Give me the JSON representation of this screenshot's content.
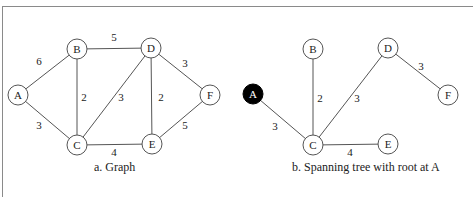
{
  "figures": [
    {
      "caption": "a. Graph",
      "nodes": [
        {
          "id": "A",
          "label": "A",
          "x": 18,
          "y": 95,
          "filled": false
        },
        {
          "id": "B",
          "label": "B",
          "x": 77,
          "y": 49,
          "filled": false
        },
        {
          "id": "D",
          "label": "D",
          "x": 151,
          "y": 48,
          "filled": false
        },
        {
          "id": "F",
          "label": "F",
          "x": 210,
          "y": 95,
          "filled": false
        },
        {
          "id": "C",
          "label": "C",
          "x": 77,
          "y": 145,
          "filled": false
        },
        {
          "id": "E",
          "label": "E",
          "x": 152,
          "y": 144,
          "filled": false
        }
      ],
      "edges": [
        {
          "from": "A",
          "to": "B",
          "weight": "6",
          "lx": 39,
          "ly": 65
        },
        {
          "from": "A",
          "to": "C",
          "weight": "3",
          "lx": 39,
          "ly": 129
        },
        {
          "from": "B",
          "to": "D",
          "weight": "5",
          "lx": 114,
          "ly": 41
        },
        {
          "from": "B",
          "to": "C",
          "weight": "2",
          "lx": 84,
          "ly": 101
        },
        {
          "from": "C",
          "to": "D",
          "weight": "3",
          "lx": 121,
          "ly": 101
        },
        {
          "from": "D",
          "to": "E",
          "weight": "2",
          "lx": 161,
          "ly": 101
        },
        {
          "from": "D",
          "to": "F",
          "weight": "3",
          "lx": 185,
          "ly": 67
        },
        {
          "from": "E",
          "to": "F",
          "weight": "5",
          "lx": 185,
          "ly": 129
        },
        {
          "from": "C",
          "to": "E",
          "weight": "4",
          "lx": 114,
          "ly": 156
        }
      ]
    },
    {
      "caption": "b. Spanning tree with root at A",
      "nodes": [
        {
          "id": "A",
          "label": "A",
          "x": 253,
          "y": 94,
          "filled": true
        },
        {
          "id": "B",
          "label": "B",
          "x": 313,
          "y": 49,
          "filled": false
        },
        {
          "id": "D",
          "label": "D",
          "x": 388,
          "y": 48,
          "filled": false
        },
        {
          "id": "F",
          "label": "F",
          "x": 448,
          "y": 95,
          "filled": false
        },
        {
          "id": "C",
          "label": "C",
          "x": 313,
          "y": 145,
          "filled": false
        },
        {
          "id": "E",
          "label": "E",
          "x": 388,
          "y": 144,
          "filled": false
        }
      ],
      "edges": [
        {
          "from": "A",
          "to": "C",
          "weight": "3",
          "lx": 275,
          "ly": 130
        },
        {
          "from": "B",
          "to": "C",
          "weight": "2",
          "lx": 320,
          "ly": 102
        },
        {
          "from": "C",
          "to": "D",
          "weight": "3",
          "lx": 357,
          "ly": 102
        },
        {
          "from": "D",
          "to": "F",
          "weight": "3",
          "lx": 421,
          "ly": 70
        },
        {
          "from": "C",
          "to": "E",
          "weight": "4",
          "lx": 350,
          "ly": 156
        }
      ]
    }
  ],
  "colors": {
    "line": "#555555",
    "node_fill": "#ffffff",
    "root_fill": "#000000",
    "text": "#222222"
  }
}
